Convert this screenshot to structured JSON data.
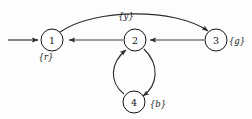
{
  "diagram": {
    "background_color": "#fdfdfd",
    "stroke_color": "#2b2b2b",
    "nodes": [
      {
        "id": "n1",
        "label": "1",
        "cx": 52,
        "cy": 40,
        "r": 11
      },
      {
        "id": "n2",
        "label": "2",
        "cx": 135,
        "cy": 40,
        "r": 11
      },
      {
        "id": "n3",
        "label": "3",
        "cx": 216,
        "cy": 40,
        "r": 11
      },
      {
        "id": "n4",
        "label": "4",
        "cx": 134,
        "cy": 102,
        "r": 11
      }
    ],
    "set_labels": [
      {
        "id": "lr",
        "text": "{r}",
        "x": 46,
        "y": 57,
        "attached_to": "n1"
      },
      {
        "id": "ly",
        "text": "{y}",
        "x": 126,
        "y": 16,
        "attached_to": "edge-1-3"
      },
      {
        "id": "lg",
        "text": "{g}",
        "x": 237,
        "y": 41,
        "attached_to": "n3"
      },
      {
        "id": "lb",
        "text": "{b}",
        "x": 158,
        "y": 104,
        "attached_to": "n4"
      }
    ],
    "edges": [
      {
        "id": "edge-start-1",
        "from": "start",
        "to": "n1",
        "kind": "straight",
        "label": ""
      },
      {
        "id": "edge-1-3",
        "from": "n1",
        "to": "n3",
        "kind": "arc-over",
        "label": "{y}"
      },
      {
        "id": "edge-3-2",
        "from": "n3",
        "to": "n2",
        "kind": "straight",
        "label": ""
      },
      {
        "id": "edge-2-1",
        "from": "n2",
        "to": "n1",
        "kind": "straight",
        "label": ""
      },
      {
        "id": "edge-2-4",
        "from": "n2",
        "to": "n4",
        "kind": "arc-right",
        "label": ""
      },
      {
        "id": "edge-4-2",
        "from": "n4",
        "to": "n2",
        "kind": "arc-left",
        "label": ""
      }
    ]
  }
}
